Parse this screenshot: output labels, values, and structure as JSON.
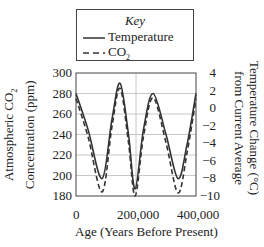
{
  "legend": {
    "title": "Key",
    "items": [
      {
        "label": "Temperature",
        "style": "solid"
      },
      {
        "label": "CO",
        "sub": "2",
        "style": "dashed"
      }
    ]
  },
  "axes": {
    "left_label_line1": "Atmospheric CO",
    "left_label_line1_sub": "2",
    "left_label_line2": "Concentration (ppm)",
    "right_label_line1": "Temperature Change (°C)",
    "right_label_line2": "from Current Average",
    "x_label": "Age (Years Before Present)",
    "left_ticks": [
      "300",
      "280",
      "260",
      "240",
      "220",
      "200",
      "180"
    ],
    "right_ticks": [
      "4",
      "2",
      "0",
      "−2",
      "−4",
      "−6",
      "−8",
      "−10"
    ],
    "x_ticks": [
      "0",
      "200,000",
      "400,000"
    ]
  },
  "chart_data": {
    "type": "line",
    "title": "",
    "xlabel": "Age (Years Before Present)",
    "ylabel": "Atmospheric CO2 Concentration (ppm)",
    "y2label": "Temperature Change (°C) from Current Average",
    "xlim": [
      0,
      400000
    ],
    "ylim": [
      180,
      300
    ],
    "y2lim": [
      -10,
      4
    ],
    "grid": true,
    "legend_position": "top (above plot)",
    "x": [
      0,
      40000,
      87000,
      120000,
      147000,
      175000,
      197000,
      225000,
      257000,
      300000,
      340000,
      370000,
      400000
    ],
    "series": [
      {
        "name": "Temperature",
        "style": "solid",
        "axis": "right",
        "values_ppm_scale": [
          280,
          245,
          197,
          255,
          290,
          240,
          187,
          245,
          280,
          240,
          197,
          230,
          280
        ]
      },
      {
        "name": "CO2",
        "style": "dashed",
        "axis": "left",
        "values": [
          275,
          238,
          184,
          248,
          285,
          232,
          180,
          238,
          276,
          232,
          183,
          222,
          275
        ]
      }
    ]
  }
}
